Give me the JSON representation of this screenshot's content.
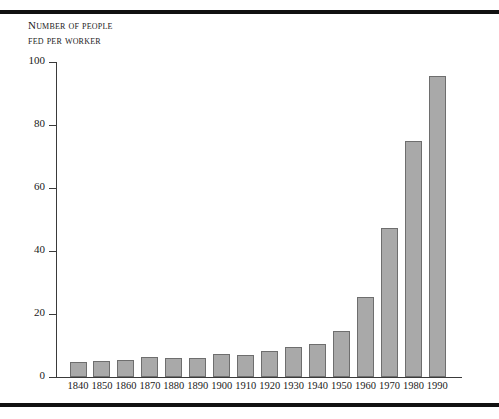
{
  "figure": {
    "background_color": "#ffffff",
    "rule_color": "#111111",
    "axis_color": "#3a3a3a",
    "bar_fill_color": "#a9a9a9",
    "bar_edge_color": "#6e6e6e",
    "axis_title_line1": "Number of people",
    "axis_title_line2": "fed per worker"
  },
  "chart_data": {
    "type": "bar",
    "title": "",
    "subtitle": "",
    "xlabel": "",
    "ylabel": "Number of people fed per worker",
    "categories": [
      "1840",
      "1850",
      "1860",
      "1870",
      "1880",
      "1890",
      "1900",
      "1910",
      "1920",
      "1930",
      "1940",
      "1950",
      "1960",
      "1970",
      "1980",
      "1990"
    ],
    "values": [
      4.8,
      5.0,
      5.3,
      6.2,
      6.1,
      5.9,
      7.3,
      7.1,
      8.3,
      9.6,
      10.5,
      14.6,
      25.4,
      47.3,
      75.0,
      95.6
    ],
    "ylim": [
      0,
      100
    ],
    "yticks": [
      0,
      20,
      40,
      60,
      80,
      100
    ],
    "ytick_labels": [
      "0",
      "20",
      "40",
      "60",
      "80",
      "100"
    ],
    "xtick_labels": [
      "1840",
      "1850",
      "1860",
      "1870",
      "1880",
      "1890",
      "1900",
      "1910",
      "1920",
      "1930",
      "1940",
      "1950",
      "1960",
      "1970",
      "1980",
      "1990"
    ],
    "grid": false,
    "legend": false,
    "legend_position": "none"
  }
}
